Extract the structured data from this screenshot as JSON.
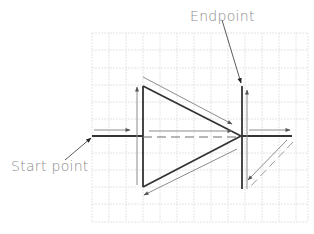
{
  "diagram": {
    "labels": {
      "endpoint": "Endpoint",
      "start_point": "Start point"
    },
    "grid": {
      "x_start": 92,
      "x_end": 308,
      "y_start": 33,
      "y_end": 222,
      "spacing": 17
    },
    "colors": {
      "thick_line": "#333333",
      "thin_arrow": "#8c8c8c",
      "grid": "#e4e4e4",
      "label_text": "#8a8a8a"
    }
  }
}
